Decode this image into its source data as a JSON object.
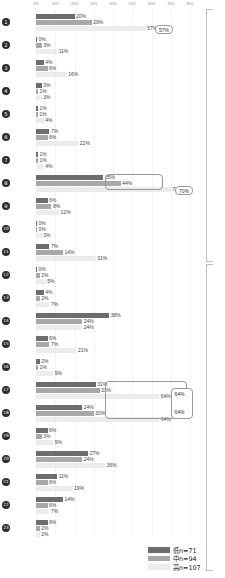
{
  "chart_data": {
    "type": "bar",
    "orientation": "horizontal",
    "title": "",
    "xlabel": "",
    "ylabel": "",
    "xlim": [
      0,
      80
    ],
    "grid": true,
    "legend_position": "bottom-right",
    "tick_labels": [
      "0%",
      "10%",
      "20%",
      "30%",
      "40%",
      "50%",
      "60%",
      "70%",
      "80%"
    ],
    "tick_values": [
      0,
      10,
      20,
      30,
      40,
      50,
      60,
      70,
      80
    ],
    "categories": [
      "1",
      "2",
      "3",
      "4",
      "5",
      "6",
      "7",
      "8",
      "9",
      "10",
      "11",
      "12",
      "13",
      "14",
      "15",
      "16",
      "17",
      "18",
      "19",
      "20",
      "21",
      "22",
      "23"
    ],
    "series": [
      {
        "name": "低n=71",
        "color": "#6d6d6d",
        "values": [
          20,
          0,
          4,
          3,
          1,
          7,
          1,
          35,
          6,
          0,
          7,
          0,
          4,
          38,
          6,
          2,
          31,
          24,
          6,
          27,
          11,
          14,
          6
        ]
      },
      {
        "name": "中n=94",
        "color": "#a8a8a8",
        "values": [
          29,
          3,
          6,
          1,
          1,
          6,
          1,
          44,
          8,
          0,
          14,
          2,
          2,
          24,
          7,
          1,
          33,
          30,
          3,
          24,
          6,
          6,
          2
        ]
      },
      {
        "name": "高n=107",
        "color": "#ececed",
        "values": [
          57,
          11,
          16,
          3,
          4,
          22,
          4,
          70,
          12,
          3,
          31,
          5,
          7,
          24,
          21,
          9,
          64,
          64,
          9,
          36,
          19,
          7,
          2
        ]
      }
    ],
    "value_labels": [
      [
        "20%",
        "29%",
        "57%"
      ],
      [
        "0%",
        "3%",
        "11%"
      ],
      [
        "4%",
        "6%",
        "16%"
      ],
      [
        "3%",
        "1%",
        "3%"
      ],
      [
        "1%",
        "1%",
        "4%"
      ],
      [
        "7%",
        "6%",
        "22%"
      ],
      [
        "1%",
        "1%",
        "4%"
      ],
      [
        "35%",
        "44%",
        "70%"
      ],
      [
        "6%",
        "8%",
        "12%"
      ],
      [
        "0%",
        "0%",
        "3%"
      ],
      [
        "7%",
        "14%",
        "31%"
      ],
      [
        "0%",
        "2%",
        "5%"
      ],
      [
        "4%",
        "2%",
        "7%"
      ],
      [
        "38%",
        "24%",
        "24%"
      ],
      [
        "6%",
        "7%",
        "21%"
      ],
      [
        "2%",
        "1%",
        "9%"
      ],
      [
        "31%",
        "33%",
        "64%"
      ],
      [
        "24%",
        "30%",
        "64%"
      ],
      [
        "6%",
        "3%",
        "9%"
      ],
      [
        "27%",
        "24%",
        "36%"
      ],
      [
        "11%",
        "6%",
        "19%"
      ],
      [
        "14%",
        "6%",
        "7%"
      ],
      [
        "6%",
        "2%",
        "2%"
      ]
    ],
    "annotations": [
      {
        "name": "highlight-row1-series3",
        "label": "57%"
      },
      {
        "name": "highlight-row8-series1-2",
        "labels": [
          "35%",
          "44%"
        ]
      },
      {
        "name": "highlight-row8-series3",
        "label": "70%"
      },
      {
        "name": "highlight-rows17-18",
        "labels": [
          "31%",
          "33%",
          "24%",
          "30%"
        ]
      },
      {
        "name": "highlight-rows17-18-series3",
        "labels": [
          "64%",
          "64%"
        ]
      }
    ],
    "brackets": [
      {
        "name": "bracket-upper",
        "from_category": "1",
        "to_category": "11"
      },
      {
        "name": "bracket-lower",
        "from_category": "12",
        "to_category": "23"
      }
    ]
  },
  "legend": {
    "items": [
      {
        "label": "低n=71",
        "color": "#6d6d6d"
      },
      {
        "label": "中n=94",
        "color": "#a8a8a8"
      },
      {
        "label": "高n=107",
        "color": "#ececed"
      }
    ]
  }
}
